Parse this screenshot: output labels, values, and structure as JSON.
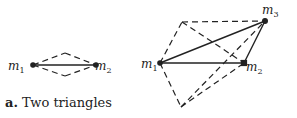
{
  "caption": {
    "tag": "a.",
    "text": "Two triangles"
  },
  "colors": {
    "stroke": "#222222",
    "background": "#ffffff"
  },
  "left_figure": {
    "points": {
      "m1": {
        "x": 33,
        "y": 65,
        "label": "m",
        "sub": "1"
      },
      "m2": {
        "x": 96,
        "y": 65,
        "label": "m",
        "sub": "2"
      },
      "top": {
        "x": 65,
        "y": 53
      },
      "bottom": {
        "x": 65,
        "y": 76
      }
    },
    "solid_edges": [
      [
        "m1",
        "m2"
      ]
    ],
    "dashed_edges": [
      [
        "m1",
        "top"
      ],
      [
        "top",
        "m2"
      ],
      [
        "m1",
        "bottom"
      ],
      [
        "bottom",
        "m2"
      ]
    ]
  },
  "right_figure": {
    "points": {
      "m1": {
        "x": 160,
        "y": 63,
        "label": "m",
        "sub": "1"
      },
      "m2": {
        "x": 244,
        "y": 63,
        "label": "m",
        "sub": "2"
      },
      "m3": {
        "x": 265,
        "y": 21,
        "label": "m",
        "sub": "3"
      },
      "top_left": {
        "x": 182,
        "y": 22
      },
      "bottom": {
        "x": 181,
        "y": 107
      }
    },
    "solid_edges": [
      [
        "m1",
        "m2"
      ],
      [
        "m1",
        "m3"
      ],
      [
        "m2",
        "m3"
      ]
    ],
    "dashed_edges": [
      [
        "m1",
        "top_left"
      ],
      [
        "top_left",
        "m3"
      ],
      [
        "top_left",
        "m2"
      ],
      [
        "m1",
        "bottom"
      ],
      [
        "bottom",
        "m3"
      ],
      [
        "bottom",
        "m2"
      ]
    ]
  }
}
